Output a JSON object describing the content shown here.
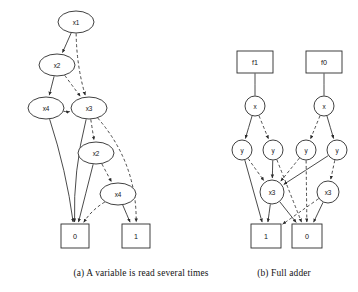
{
  "figure": {
    "background_color": "#ffffff",
    "ink_color": "#2b2b2b",
    "width": 358,
    "height": 292
  },
  "captions": [
    {
      "id": "caption-a",
      "text": "(a) A variable is read several times",
      "x": 141,
      "y": 276
    },
    {
      "id": "caption-b",
      "text": "(b) Full adder",
      "x": 284,
      "y": 276
    }
  ],
  "subfigures": [
    {
      "id": "subfig-a",
      "caption_ref": "(a) A variable is read several times",
      "nodes": [
        {
          "id": "a-x1",
          "label": "x1",
          "shape": "ellipse",
          "cx": 76,
          "cy": 22,
          "rx": 18,
          "ry": 11
        },
        {
          "id": "a-x2t",
          "label": "x2",
          "shape": "ellipse",
          "cx": 57,
          "cy": 65,
          "rx": 18,
          "ry": 11
        },
        {
          "id": "a-x4l",
          "label": "x4",
          "shape": "ellipse",
          "cx": 46,
          "cy": 108,
          "rx": 18,
          "ry": 11
        },
        {
          "id": "a-x3",
          "label": "x3",
          "shape": "ellipse",
          "cx": 89,
          "cy": 108,
          "rx": 18,
          "ry": 11
        },
        {
          "id": "a-x2b",
          "label": "x2",
          "shape": "ellipse",
          "cx": 96,
          "cy": 153,
          "rx": 18,
          "ry": 11
        },
        {
          "id": "a-x4b",
          "label": "x4",
          "shape": "ellipse",
          "cx": 118,
          "cy": 194,
          "rx": 18,
          "ry": 11
        },
        {
          "id": "a-t0",
          "label": "0",
          "shape": "rect",
          "cx": 75,
          "cy": 236,
          "rx": 14,
          "ry": 12
        },
        {
          "id": "a-t1",
          "label": "1",
          "shape": "rect",
          "cx": 136,
          "cy": 236,
          "rx": 14,
          "ry": 12
        }
      ],
      "edges": [
        {
          "from": "a-x1",
          "to": "a-x2t",
          "style": "solid",
          "arrow": true
        },
        {
          "from": "a-x1",
          "to": "a-x3",
          "style": "dashed",
          "arrow": true,
          "bow": 6
        },
        {
          "from": "a-x2t",
          "to": "a-x4l",
          "style": "solid",
          "arrow": true
        },
        {
          "from": "a-x2t",
          "to": "a-x3",
          "style": "dashed",
          "arrow": true
        },
        {
          "from": "a-x4l",
          "to": "a-t0",
          "style": "solid",
          "arrow": true,
          "bow": -6
        },
        {
          "from": "a-x4l",
          "to": "a-x3",
          "style": "dashed",
          "arrow": true,
          "bow": 4
        },
        {
          "from": "a-x3",
          "to": "a-t0",
          "style": "solid",
          "arrow": true,
          "bow": 9
        },
        {
          "from": "a-x3",
          "to": "a-x2b",
          "style": "dashed",
          "arrow": true
        },
        {
          "from": "a-x3",
          "to": "a-t1",
          "style": "dashed",
          "arrow": true,
          "bow": -26
        },
        {
          "from": "a-x2b",
          "to": "a-t0",
          "style": "solid",
          "arrow": true
        },
        {
          "from": "a-x2b",
          "to": "a-x4b",
          "style": "dashed",
          "arrow": true
        },
        {
          "from": "a-x4b",
          "to": "a-t0",
          "style": "dashed",
          "arrow": true,
          "bow": 7
        },
        {
          "from": "a-x4b",
          "to": "a-t1",
          "style": "solid",
          "arrow": true
        }
      ]
    },
    {
      "id": "subfig-b",
      "caption_ref": "(b) Full adder",
      "nodes": [
        {
          "id": "b-f1",
          "label": "f1",
          "shape": "rect",
          "cx": 255,
          "cy": 62,
          "rx": 18,
          "ry": 11
        },
        {
          "id": "b-f0",
          "label": "f0",
          "shape": "rect",
          "cx": 324,
          "cy": 62,
          "rx": 18,
          "ry": 11
        },
        {
          "id": "b-xl",
          "label": "x",
          "shape": "circle",
          "cx": 255,
          "cy": 106,
          "rx": 10,
          "ry": 10
        },
        {
          "id": "b-xr",
          "label": "x",
          "shape": "circle",
          "cx": 324,
          "cy": 106,
          "rx": 10,
          "ry": 10
        },
        {
          "id": "b-y1",
          "label": "y",
          "shape": "circle",
          "cx": 242,
          "cy": 150,
          "rx": 10,
          "ry": 10
        },
        {
          "id": "b-y2",
          "label": "y",
          "shape": "circle",
          "cx": 273,
          "cy": 150,
          "rx": 10,
          "ry": 10
        },
        {
          "id": "b-y3",
          "label": "y",
          "shape": "circle",
          "cx": 306,
          "cy": 150,
          "rx": 10,
          "ry": 10
        },
        {
          "id": "b-y4",
          "label": "y",
          "shape": "circle",
          "cx": 337,
          "cy": 150,
          "rx": 10,
          "ry": 10
        },
        {
          "id": "b-z1",
          "label": "x3",
          "shape": "circle",
          "cx": 272,
          "cy": 192,
          "rx": 12,
          "ry": 12
        },
        {
          "id": "b-z2",
          "label": "x3",
          "shape": "circle",
          "cx": 328,
          "cy": 192,
          "rx": 11,
          "ry": 11
        },
        {
          "id": "b-t1",
          "label": "1",
          "shape": "rect",
          "cx": 266,
          "cy": 236,
          "rx": 15,
          "ry": 12
        },
        {
          "id": "b-t0",
          "label": "0",
          "shape": "rect",
          "cx": 307,
          "cy": 236,
          "rx": 15,
          "ry": 12
        }
      ],
      "edges": [
        {
          "from": "b-f1",
          "to": "b-xl",
          "style": "solid",
          "arrow": false
        },
        {
          "from": "b-f0",
          "to": "b-xr",
          "style": "solid",
          "arrow": false
        },
        {
          "from": "b-xl",
          "to": "b-y1",
          "style": "solid",
          "arrow": true
        },
        {
          "from": "b-xl",
          "to": "b-y2",
          "style": "dashed",
          "arrow": true
        },
        {
          "from": "b-xr",
          "to": "b-y3",
          "style": "dashed",
          "arrow": true
        },
        {
          "from": "b-xr",
          "to": "b-y4",
          "style": "solid",
          "arrow": true
        },
        {
          "from": "b-y1",
          "to": "b-t1",
          "style": "solid",
          "arrow": true
        },
        {
          "from": "b-y1",
          "to": "b-z1",
          "style": "dashed",
          "arrow": true
        },
        {
          "from": "b-y2",
          "to": "b-z1",
          "style": "solid",
          "arrow": true
        },
        {
          "from": "b-y2",
          "to": "b-t0",
          "style": "dashed",
          "arrow": true
        },
        {
          "from": "b-y3",
          "to": "b-z1",
          "style": "dashed",
          "arrow": true
        },
        {
          "from": "b-y3",
          "to": "b-t0",
          "style": "dashed",
          "arrow": true
        },
        {
          "from": "b-y4",
          "to": "b-z1",
          "style": "solid",
          "arrow": true
        },
        {
          "from": "b-y4",
          "to": "b-z2",
          "style": "dashed",
          "arrow": true
        },
        {
          "from": "b-z1",
          "to": "b-t1",
          "style": "solid",
          "arrow": true
        },
        {
          "from": "b-z1",
          "to": "b-t0",
          "style": "solid",
          "arrow": true
        },
        {
          "from": "b-z2",
          "to": "b-t1",
          "style": "dashed",
          "arrow": true
        },
        {
          "from": "b-z2",
          "to": "b-t0",
          "style": "solid",
          "arrow": true
        }
      ]
    }
  ]
}
